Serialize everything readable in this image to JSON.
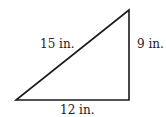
{
  "diagram": {
    "type": "right-triangle",
    "vertices": {
      "bottom_left": [
        16,
        100
      ],
      "bottom_right": [
        129,
        100
      ],
      "top_right": [
        129,
        10
      ]
    },
    "sides": {
      "hypotenuse": {
        "label": "15 in.",
        "x": 40,
        "y": 48
      },
      "vertical": {
        "label": "9 in.",
        "x": 137,
        "y": 48
      },
      "base": {
        "label": "12 in.",
        "x": 60,
        "y": 114
      }
    },
    "stroke_color": "#1a1a1a"
  }
}
